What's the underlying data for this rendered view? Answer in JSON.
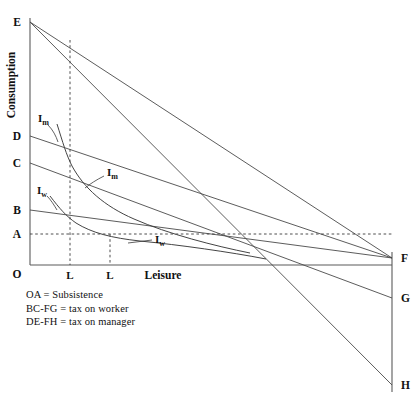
{
  "figure": {
    "axes": {
      "y_title": "Consumption",
      "x_title": "Leisure",
      "origin_label": "O"
    },
    "y_axis_points": [
      {
        "label": "E",
        "y": 22
      },
      {
        "label": "D",
        "y": 136
      },
      {
        "label": "C",
        "y": 163
      },
      {
        "label": "B",
        "y": 210
      },
      {
        "label": "A",
        "y": 234
      }
    ],
    "right_axis_points": [
      {
        "label": "F",
        "y": 258
      },
      {
        "label": "G",
        "y": 298
      },
      {
        "label": "H",
        "y": 385
      }
    ],
    "x_ticks": [
      {
        "label": "L",
        "x": 70
      },
      {
        "label": "L",
        "x": 110
      }
    ],
    "curve_labels": [
      {
        "name": "Im-upper",
        "base": "I",
        "sub": "m"
      },
      {
        "name": "Im-right",
        "base": "I",
        "sub": "m"
      },
      {
        "name": "Iw-upper",
        "base": "I",
        "sub": "w"
      },
      {
        "name": "Iw-right",
        "base": "I",
        "sub": "w"
      }
    ],
    "legend": [
      "OA = Subsistence",
      "BC-FG = tax on worker",
      "DE-FH = tax on manager"
    ],
    "colors": {
      "line": "#4a4a4a",
      "axis": "#5a5a5a",
      "text": "#111111",
      "background": "#ffffff"
    }
  }
}
